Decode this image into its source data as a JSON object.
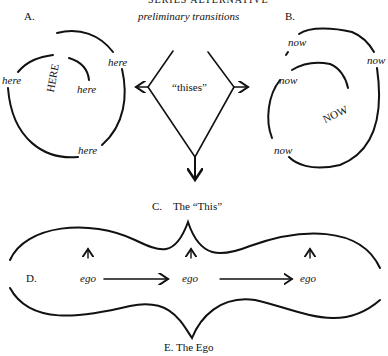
{
  "header": {
    "cut_title": "SERIES ALTERNATIVE",
    "subtitle": "preliminary transitions"
  },
  "panel_a": {
    "label": "A.",
    "center_word": "HERE",
    "ring_words": [
      "here",
      "here",
      "here",
      "here"
    ]
  },
  "panel_b": {
    "label": "B.",
    "center_word": "NOW",
    "ring_words": [
      "now",
      "now",
      "now",
      "now"
    ]
  },
  "panel_c": {
    "center_word": "“thises”",
    "caption": "C.    The “This”"
  },
  "panel_d": {
    "label": "D.",
    "nodes": [
      "ego",
      "ego",
      "ego"
    ]
  },
  "panel_e": {
    "caption": "E. The Ego"
  }
}
